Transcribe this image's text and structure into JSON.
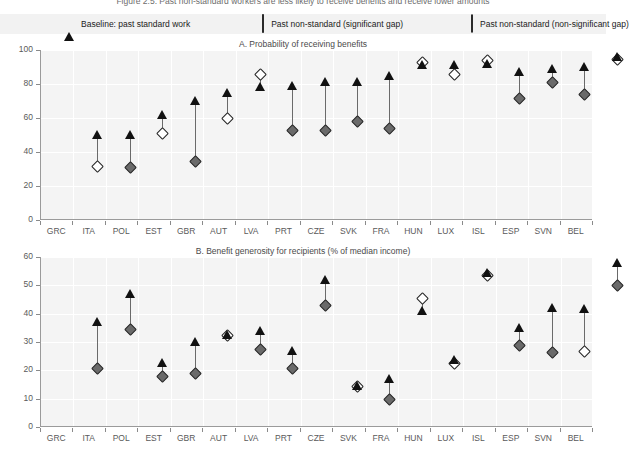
{
  "top_cutoff_text": "Figure 2.5. Past non-standard workers are less likely to receive benefits and receive lower amounts",
  "legend": {
    "items": [
      {
        "marker": "triangle-filled",
        "label": "Baseline: past standard work"
      },
      {
        "marker": "diamond-filled",
        "label": "Past non-standard (significant gap)"
      },
      {
        "marker": "diamond-open",
        "label": "Past non-standard (non-significant gap)"
      }
    ]
  },
  "chart_data": [
    {
      "type": "scatter",
      "panel": "A",
      "title": "A. Probability of receiving benefits",
      "xlabel": "",
      "ylabel": "",
      "ylim": [
        0,
        100
      ],
      "yticks": [
        0,
        20,
        40,
        60,
        80,
        100
      ],
      "grid": true,
      "legend_position": "top",
      "categories": [
        "GRC",
        "ITA",
        "POL",
        "EST",
        "GBR",
        "AUT",
        "LVA",
        "PRT",
        "CZE",
        "SVK",
        "FRA",
        "HUN",
        "LUX",
        "ISL",
        "ESP",
        "SVN",
        "BEL"
      ],
      "series": [
        {
          "name": "Baseline: past standard work",
          "marker": "triangle-filled",
          "values": [
            50,
            50,
            62,
            70,
            75,
            78,
            79,
            81,
            81,
            85,
            91,
            91,
            92,
            87,
            89,
            90,
            96
          ]
        },
        {
          "name": "Past non-standard",
          "marker": "diamond",
          "values": [
            32,
            31,
            51,
            35,
            60,
            86,
            53,
            53,
            58,
            54,
            93,
            86,
            94,
            72,
            81,
            74,
            95
          ],
          "significant": [
            false,
            true,
            false,
            true,
            false,
            false,
            true,
            true,
            true,
            true,
            false,
            false,
            false,
            true,
            true,
            true,
            false
          ]
        }
      ]
    },
    {
      "type": "scatter",
      "panel": "B",
      "title": "B. Benefit generosity for recipients (% of median income)",
      "xlabel": "",
      "ylabel": "",
      "ylim": [
        0,
        60
      ],
      "yticks": [
        0,
        10,
        20,
        30,
        40,
        50,
        60
      ],
      "grid": true,
      "legend_position": "top",
      "categories": [
        "GRC",
        "ITA",
        "POL",
        "EST",
        "GBR",
        "AUT",
        "LVA",
        "PRT",
        "CZE",
        "SVK",
        "FRA",
        "HUN",
        "LUX",
        "ISL",
        "ESP",
        "SVN",
        "BEL"
      ],
      "series": [
        {
          "name": "Baseline: past standard work",
          "marker": "triangle-filled",
          "values": [
            37,
            47,
            22.5,
            30,
            32.5,
            34,
            27,
            52,
            14.5,
            17,
            41,
            23.5,
            54.5,
            35,
            42,
            41.5,
            58
          ]
        },
        {
          "name": "Past non-standard",
          "marker": "diamond",
          "values": [
            20.7,
            34.5,
            18,
            19,
            32.5,
            27.5,
            21,
            43,
            14.5,
            10,
            45.5,
            22.5,
            53.5,
            29,
            26.5,
            27,
            50
          ],
          "significant": [
            true,
            true,
            true,
            true,
            false,
            true,
            true,
            true,
            false,
            true,
            false,
            false,
            false,
            true,
            true,
            false,
            true
          ]
        }
      ]
    }
  ],
  "colors": {
    "plot_background": "#f4f4f4",
    "grid": "#ffffff",
    "axis": "#9a9a9a",
    "triangle": "#111111",
    "diamond_filled": "#6a6a6a",
    "diamond_open": "#ffffff",
    "connector": "#6a6a6a",
    "tick_text": "#5a5a5a",
    "legend_background": "#f2f2f2"
  }
}
